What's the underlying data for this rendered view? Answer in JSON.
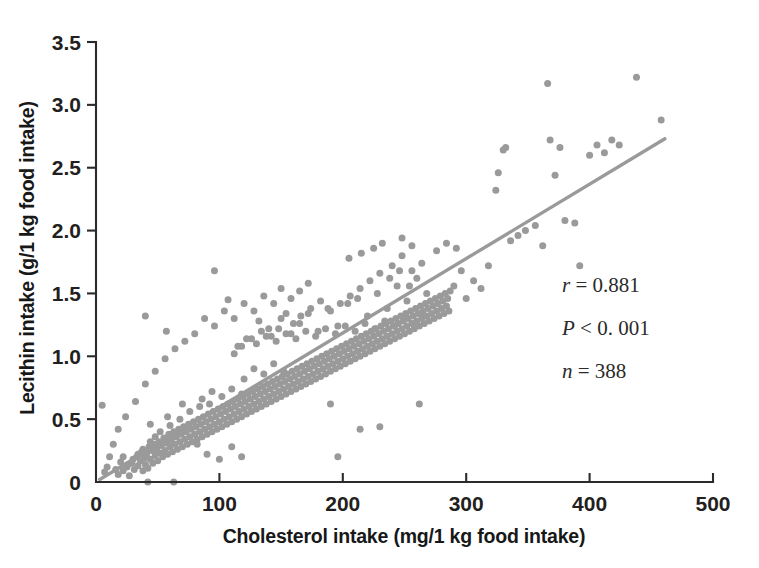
{
  "chart_data": {
    "type": "scatter",
    "title": "",
    "xlabel": "Cholesterol intake (mg/1 kg food intake)",
    "ylabel": "Lecithin intake (g/1 kg food intake)",
    "xlim": [
      0,
      500
    ],
    "ylim": [
      0,
      3.5
    ],
    "xticks": [
      0,
      100,
      200,
      300,
      400,
      500
    ],
    "xtick_labels": [
      "0",
      "100",
      "200",
      "300",
      "400",
      "500"
    ],
    "yticks": [
      0,
      0.5,
      1.0,
      1.5,
      2.0,
      2.5,
      3.0,
      3.5
    ],
    "ytick_labels": [
      "0",
      "0.5",
      "1.0",
      "1.5",
      "2.0",
      "2.5",
      "3.0",
      "3.5"
    ],
    "grid": false,
    "legend": null,
    "point_color": "#9a9a9a",
    "point_size": 7,
    "annotations": [
      {
        "label": "r",
        "relation": "=",
        "value": "0.881",
        "text": "r = 0.881"
      },
      {
        "label": "P",
        "relation": "<",
        "value": "0. 001",
        "text": "P < 0. 001"
      },
      {
        "label": "n",
        "relation": "=",
        "value": "388",
        "text": "n = 388"
      }
    ],
    "trendline": {
      "type": "linear",
      "color": "#9a9a9a",
      "x_start": 3,
      "y_start": 0.02,
      "x_end": 461,
      "y_end": 2.73,
      "slope": 0.005917,
      "intercept": 0.0022
    },
    "n_points": 388,
    "correlation_r": 0.881,
    "p_value": "<0.001",
    "points": [
      [
        5,
        0.61
      ],
      [
        18,
        0.06
      ],
      [
        22,
        0.09
      ],
      [
        25,
        0.12
      ],
      [
        27,
        0.05
      ],
      [
        29,
        0.15
      ],
      [
        31,
        0.1
      ],
      [
        33,
        0.2
      ],
      [
        34,
        0.13
      ],
      [
        36,
        0.17
      ],
      [
        37,
        0.24
      ],
      [
        38,
        0.09
      ],
      [
        39,
        0.19
      ],
      [
        40,
        0.14
      ],
      [
        41,
        0.22
      ],
      [
        42,
        0.11
      ],
      [
        43,
        0.28
      ],
      [
        44,
        0.18
      ],
      [
        45,
        0.25
      ],
      [
        46,
        0.15
      ],
      [
        42,
        0.0
      ],
      [
        63,
        0.0
      ],
      [
        47,
        0.3
      ],
      [
        48,
        0.21
      ],
      [
        49,
        0.26
      ],
      [
        50,
        0.17
      ],
      [
        51,
        0.32
      ],
      [
        52,
        0.23
      ],
      [
        53,
        0.29
      ],
      [
        54,
        0.2
      ],
      [
        44,
        0.46
      ],
      [
        55,
        0.35
      ],
      [
        56,
        0.25
      ],
      [
        57,
        0.31
      ],
      [
        58,
        0.22
      ],
      [
        59,
        0.38
      ],
      [
        60,
        0.28
      ],
      [
        61,
        0.33
      ],
      [
        62,
        0.24
      ],
      [
        63,
        0.4
      ],
      [
        64,
        0.3
      ],
      [
        65,
        0.36
      ],
      [
        66,
        0.26
      ],
      [
        67,
        0.42
      ],
      [
        68,
        0.32
      ],
      [
        69,
        0.38
      ],
      [
        70,
        0.28
      ],
      [
        71,
        0.44
      ],
      [
        72,
        0.34
      ],
      [
        73,
        0.4
      ],
      [
        58,
        0.52
      ],
      [
        74,
        0.3
      ],
      [
        75,
        0.46
      ],
      [
        76,
        0.36
      ],
      [
        77,
        0.42
      ],
      [
        78,
        0.32
      ],
      [
        79,
        0.48
      ],
      [
        80,
        0.38
      ],
      [
        81,
        0.44
      ],
      [
        82,
        0.34
      ],
      [
        83,
        0.5
      ],
      [
        84,
        0.4
      ],
      [
        85,
        0.46
      ],
      [
        86,
        0.36
      ],
      [
        87,
        0.52
      ],
      [
        88,
        0.42
      ],
      [
        89,
        0.48
      ],
      [
        90,
        0.38
      ],
      [
        91,
        0.54
      ],
      [
        92,
        0.44
      ],
      [
        70,
        0.62
      ],
      [
        93,
        0.5
      ],
      [
        94,
        0.4
      ],
      [
        95,
        0.56
      ],
      [
        96,
        0.46
      ],
      [
        97,
        0.52
      ],
      [
        98,
        0.42
      ],
      [
        99,
        0.58
      ],
      [
        100,
        0.48
      ],
      [
        101,
        0.54
      ],
      [
        102,
        0.44
      ],
      [
        103,
        0.6
      ],
      [
        104,
        0.5
      ],
      [
        105,
        0.56
      ],
      [
        106,
        0.46
      ],
      [
        107,
        0.62
      ],
      [
        108,
        0.52
      ],
      [
        109,
        0.58
      ],
      [
        110,
        0.48
      ],
      [
        111,
        0.64
      ],
      [
        40,
        1.32
      ],
      [
        57,
        1.2
      ],
      [
        112,
        0.54
      ],
      [
        113,
        0.6
      ],
      [
        114,
        0.5
      ],
      [
        115,
        0.66
      ],
      [
        116,
        0.56
      ],
      [
        117,
        0.62
      ],
      [
        118,
        0.52
      ],
      [
        119,
        0.68
      ],
      [
        120,
        0.58
      ],
      [
        121,
        0.64
      ],
      [
        122,
        0.54
      ],
      [
        123,
        0.7
      ],
      [
        124,
        0.6
      ],
      [
        125,
        0.66
      ],
      [
        126,
        0.56
      ],
      [
        127,
        0.72
      ],
      [
        128,
        0.62
      ],
      [
        129,
        0.68
      ],
      [
        130,
        0.58
      ],
      [
        131,
        0.74
      ],
      [
        132,
        0.64
      ],
      [
        133,
        0.7
      ],
      [
        134,
        0.6
      ],
      [
        96,
        1.68
      ],
      [
        107,
        1.45
      ],
      [
        135,
        0.76
      ],
      [
        136,
        0.66
      ],
      [
        137,
        0.72
      ],
      [
        138,
        0.62
      ],
      [
        139,
        0.78
      ],
      [
        140,
        0.68
      ],
      [
        141,
        0.74
      ],
      [
        142,
        0.64
      ],
      [
        143,
        0.8
      ],
      [
        144,
        0.7
      ],
      [
        145,
        0.76
      ],
      [
        146,
        0.66
      ],
      [
        147,
        0.82
      ],
      [
        148,
        0.72
      ],
      [
        149,
        0.78
      ],
      [
        150,
        0.68
      ],
      [
        151,
        0.84
      ],
      [
        152,
        0.74
      ],
      [
        153,
        0.8
      ],
      [
        154,
        0.7
      ],
      [
        155,
        0.86
      ],
      [
        156,
        0.76
      ],
      [
        157,
        0.82
      ],
      [
        82,
        0.3
      ],
      [
        90,
        0.22
      ],
      [
        100,
        0.18
      ],
      [
        110,
        0.28
      ],
      [
        118,
        0.2
      ],
      [
        158,
        0.72
      ],
      [
        159,
        0.88
      ],
      [
        160,
        0.78
      ],
      [
        161,
        0.84
      ],
      [
        162,
        0.74
      ],
      [
        163,
        0.9
      ],
      [
        164,
        0.8
      ],
      [
        165,
        0.86
      ],
      [
        166,
        0.76
      ],
      [
        167,
        0.92
      ],
      [
        168,
        0.82
      ],
      [
        169,
        0.88
      ],
      [
        170,
        0.78
      ],
      [
        171,
        0.94
      ],
      [
        172,
        0.84
      ],
      [
        173,
        0.9
      ],
      [
        174,
        0.8
      ],
      [
        175,
        0.96
      ],
      [
        176,
        0.86
      ],
      [
        177,
        0.92
      ],
      [
        132,
        1.28
      ],
      [
        140,
        1.22
      ],
      [
        150,
        1.3
      ],
      [
        158,
        1.18
      ],
      [
        165,
        1.26
      ],
      [
        178,
        0.82
      ],
      [
        179,
        0.98
      ],
      [
        180,
        0.88
      ],
      [
        181,
        0.94
      ],
      [
        182,
        0.84
      ],
      [
        183,
        1.0
      ],
      [
        184,
        0.9
      ],
      [
        185,
        0.96
      ],
      [
        186,
        0.86
      ],
      [
        187,
        1.02
      ],
      [
        188,
        0.92
      ],
      [
        189,
        0.98
      ],
      [
        190,
        0.88
      ],
      [
        191,
        1.04
      ],
      [
        192,
        0.94
      ],
      [
        193,
        1.0
      ],
      [
        194,
        0.9
      ],
      [
        195,
        1.06
      ],
      [
        196,
        0.96
      ],
      [
        197,
        1.02
      ],
      [
        172,
        1.34
      ],
      [
        180,
        1.2
      ],
      [
        188,
        1.38
      ],
      [
        196,
        1.24
      ],
      [
        204,
        1.42
      ],
      [
        198,
        0.92
      ],
      [
        199,
        1.08
      ],
      [
        200,
        0.98
      ],
      [
        201,
        1.04
      ],
      [
        202,
        0.94
      ],
      [
        203,
        1.1
      ],
      [
        204,
        1.0
      ],
      [
        205,
        1.06
      ],
      [
        206,
        0.96
      ],
      [
        207,
        1.12
      ],
      [
        208,
        1.02
      ],
      [
        209,
        1.08
      ],
      [
        210,
        0.98
      ],
      [
        211,
        1.14
      ],
      [
        212,
        1.04
      ],
      [
        213,
        1.1
      ],
      [
        214,
        1.0
      ],
      [
        215,
        1.16
      ],
      [
        216,
        1.06
      ],
      [
        217,
        1.12
      ],
      [
        212,
        1.46
      ],
      [
        220,
        1.32
      ],
      [
        228,
        1.5
      ],
      [
        236,
        1.38
      ],
      [
        244,
        1.56
      ],
      [
        218,
        1.02
      ],
      [
        219,
        1.18
      ],
      [
        220,
        1.08
      ],
      [
        221,
        1.14
      ],
      [
        222,
        1.04
      ],
      [
        223,
        1.2
      ],
      [
        224,
        1.1
      ],
      [
        225,
        1.16
      ],
      [
        226,
        1.06
      ],
      [
        227,
        1.22
      ],
      [
        228,
        1.12
      ],
      [
        229,
        1.18
      ],
      [
        230,
        1.08
      ],
      [
        231,
        1.24
      ],
      [
        232,
        1.14
      ],
      [
        233,
        1.2
      ],
      [
        234,
        1.1
      ],
      [
        235,
        1.26
      ],
      [
        236,
        1.16
      ],
      [
        237,
        1.22
      ],
      [
        252,
        1.44
      ],
      [
        260,
        1.62
      ],
      [
        268,
        1.5
      ],
      [
        205,
        1.78
      ],
      [
        215,
        1.82
      ],
      [
        238,
        1.12
      ],
      [
        239,
        1.28
      ],
      [
        240,
        1.18
      ],
      [
        241,
        1.24
      ],
      [
        242,
        1.14
      ],
      [
        243,
        1.3
      ],
      [
        244,
        1.2
      ],
      [
        245,
        1.26
      ],
      [
        246,
        1.16
      ],
      [
        247,
        1.32
      ],
      [
        248,
        1.22
      ],
      [
        249,
        1.28
      ],
      [
        250,
        1.18
      ],
      [
        251,
        1.34
      ],
      [
        252,
        1.24
      ],
      [
        253,
        1.3
      ],
      [
        254,
        1.2
      ],
      [
        255,
        1.36
      ],
      [
        256,
        1.26
      ],
      [
        257,
        1.32
      ],
      [
        225,
        1.86
      ],
      [
        232,
        1.9
      ],
      [
        240,
        1.72
      ],
      [
        248,
        1.8
      ],
      [
        256,
        1.68
      ],
      [
        258,
        1.22
      ],
      [
        259,
        1.38
      ],
      [
        260,
        1.28
      ],
      [
        261,
        1.34
      ],
      [
        262,
        1.24
      ],
      [
        263,
        1.4
      ],
      [
        264,
        1.3
      ],
      [
        265,
        1.36
      ],
      [
        266,
        1.26
      ],
      [
        267,
        1.42
      ],
      [
        268,
        1.32
      ],
      [
        269,
        1.38
      ],
      [
        270,
        1.28
      ],
      [
        271,
        1.44
      ],
      [
        272,
        1.34
      ],
      [
        190,
        0.62
      ],
      [
        196,
        0.2
      ],
      [
        214,
        0.42
      ],
      [
        230,
        0.44
      ],
      [
        262,
        0.62
      ],
      [
        273,
        1.4
      ],
      [
        274,
        1.3
      ],
      [
        275,
        1.46
      ],
      [
        276,
        1.36
      ],
      [
        277,
        1.42
      ],
      [
        278,
        1.32
      ],
      [
        279,
        1.48
      ],
      [
        280,
        1.38
      ],
      [
        281,
        1.44
      ],
      [
        282,
        1.34
      ],
      [
        283,
        1.5
      ],
      [
        284,
        1.4
      ],
      [
        285,
        1.46
      ],
      [
        286,
        1.36
      ],
      [
        287,
        1.52
      ],
      [
        120,
        0.82
      ],
      [
        128,
        0.9
      ],
      [
        136,
        0.86
      ],
      [
        144,
        0.94
      ],
      [
        152,
        0.88
      ],
      [
        115,
        1.08
      ],
      [
        122,
        1.14
      ],
      [
        130,
        1.1
      ],
      [
        138,
        1.16
      ],
      [
        146,
        1.12
      ],
      [
        154,
        1.18
      ],
      [
        162,
        1.14
      ],
      [
        170,
        1.2
      ],
      [
        178,
        1.16
      ],
      [
        186,
        1.22
      ],
      [
        194,
        1.18
      ],
      [
        202,
        1.24
      ],
      [
        210,
        1.2
      ],
      [
        218,
        1.26
      ],
      [
        226,
        1.22
      ],
      [
        234,
        1.28
      ],
      [
        242,
        1.24
      ],
      [
        250,
        1.3
      ],
      [
        258,
        1.26
      ],
      [
        266,
        1.32
      ],
      [
        86,
        0.66
      ],
      [
        94,
        0.72
      ],
      [
        102,
        0.68
      ],
      [
        110,
        0.74
      ],
      [
        118,
        0.7
      ],
      [
        76,
        0.56
      ],
      [
        84,
        0.6
      ],
      [
        92,
        0.62
      ],
      [
        68,
        0.5
      ],
      [
        60,
        0.45
      ],
      [
        52,
        0.4
      ],
      [
        48,
        0.36
      ],
      [
        44,
        0.32
      ],
      [
        38,
        0.26
      ],
      [
        34,
        0.22
      ],
      [
        30,
        0.18
      ],
      [
        26,
        0.14
      ],
      [
        22,
        0.2
      ],
      [
        20,
        0.16
      ],
      [
        16,
        0.1
      ],
      [
        290,
        1.56
      ],
      [
        296,
        1.68
      ],
      [
        300,
        1.46
      ],
      [
        306,
        1.6
      ],
      [
        312,
        1.54
      ],
      [
        318,
        1.72
      ],
      [
        324,
        2.32
      ],
      [
        326,
        2.46
      ],
      [
        330,
        2.64
      ],
      [
        332,
        2.66
      ],
      [
        336,
        1.92
      ],
      [
        342,
        1.96
      ],
      [
        348,
        2.0
      ],
      [
        356,
        2.04
      ],
      [
        362,
        1.88
      ],
      [
        366,
        3.17
      ],
      [
        368,
        2.72
      ],
      [
        372,
        2.44
      ],
      [
        376,
        2.66
      ],
      [
        380,
        2.08
      ],
      [
        388,
        2.06
      ],
      [
        392,
        1.72
      ],
      [
        400,
        2.6
      ],
      [
        406,
        2.68
      ],
      [
        412,
        2.62
      ],
      [
        418,
        2.72
      ],
      [
        424,
        2.68
      ],
      [
        438,
        3.22
      ],
      [
        458,
        2.88
      ],
      [
        276,
        1.84
      ],
      [
        284,
        1.9
      ],
      [
        292,
        1.86
      ],
      [
        264,
        1.74
      ],
      [
        256,
        1.88
      ],
      [
        248,
        1.94
      ],
      [
        165,
        1.52
      ],
      [
        172,
        1.58
      ],
      [
        158,
        1.46
      ],
      [
        150,
        1.54
      ],
      [
        144,
        1.42
      ],
      [
        136,
        1.48
      ],
      [
        128,
        1.36
      ],
      [
        120,
        1.42
      ],
      [
        112,
        1.3
      ],
      [
        104,
        1.36
      ],
      [
        96,
        1.24
      ],
      [
        88,
        1.3
      ],
      [
        80,
        1.18
      ],
      [
        72,
        1.12
      ],
      [
        64,
        1.06
      ],
      [
        56,
        0.98
      ],
      [
        48,
        0.88
      ],
      [
        40,
        0.78
      ],
      [
        32,
        0.64
      ],
      [
        24,
        0.52
      ],
      [
        18,
        0.42
      ],
      [
        14,
        0.3
      ],
      [
        11,
        0.2
      ],
      [
        9,
        0.12
      ],
      [
        7,
        0.08
      ],
      [
        206,
        1.48
      ],
      [
        214,
        1.54
      ],
      [
        222,
        1.6
      ],
      [
        230,
        1.66
      ],
      [
        238,
        1.62
      ],
      [
        246,
        1.68
      ],
      [
        254,
        1.56
      ],
      [
        198,
        1.42
      ],
      [
        190,
        1.36
      ],
      [
        182,
        1.44
      ],
      [
        174,
        1.38
      ],
      [
        166,
        1.32
      ],
      [
        160,
        1.26
      ],
      [
        154,
        1.34
      ],
      [
        148,
        1.22
      ],
      [
        142,
        1.16
      ],
      [
        134,
        1.2
      ],
      [
        126,
        1.14
      ],
      [
        118,
        1.08
      ],
      [
        112,
        1.02
      ]
    ]
  }
}
